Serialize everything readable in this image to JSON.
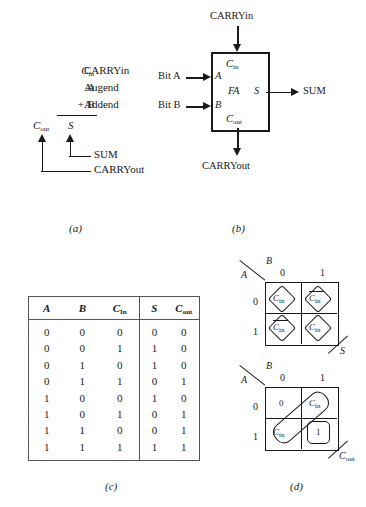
{
  "figure": {
    "panel_labels": {
      "a": "(a)",
      "b": "(b)",
      "c": "(c)",
      "d": "(d)"
    }
  },
  "panel_a": {
    "operands": [
      {
        "symbol": "C",
        "subscript": "in",
        "name": "CARRYin"
      },
      {
        "symbol": "A",
        "subscript": "",
        "name": "Augend"
      },
      {
        "symbol": "+ B",
        "subscript": "",
        "name": "Addend"
      }
    ],
    "results": [
      {
        "symbol": "C",
        "subscript": "out"
      },
      {
        "symbol": "S",
        "subscript": ""
      }
    ],
    "annotations": [
      {
        "label": "SUM",
        "points_to": "S"
      },
      {
        "label": "CARRYout",
        "points_to": "C_out"
      }
    ]
  },
  "panel_b": {
    "block_label": "FA",
    "port_top": {
      "pin": "C",
      "pin_sub": "in",
      "external": "CARRYin"
    },
    "port_bottom": {
      "pin": "C",
      "pin_sub": "out",
      "external": "CARRYout"
    },
    "ports_left": [
      {
        "pin": "A",
        "external": "Bit A"
      },
      {
        "pin": "B",
        "external": "Bit B"
      }
    ],
    "port_right": {
      "pin": "S",
      "external": "SUM"
    }
  },
  "panel_c": {
    "headers_inputs": [
      "A",
      "B",
      "C"
    ],
    "header_cin_sub": "In",
    "headers_outputs": [
      "S",
      "C"
    ],
    "header_cout_sub": "out",
    "rows": [
      {
        "A": "0",
        "B": "0",
        "Cin": "0",
        "S": "0",
        "Cout": "0"
      },
      {
        "A": "0",
        "B": "0",
        "Cin": "1",
        "S": "1",
        "Cout": "0"
      },
      {
        "A": "0",
        "B": "1",
        "Cin": "0",
        "S": "1",
        "Cout": "0"
      },
      {
        "A": "0",
        "B": "1",
        "Cin": "1",
        "S": "0",
        "Cout": "1"
      },
      {
        "A": "1",
        "B": "0",
        "Cin": "0",
        "S": "1",
        "Cout": "0"
      },
      {
        "A": "1",
        "B": "0",
        "Cin": "1",
        "S": "0",
        "Cout": "1"
      },
      {
        "A": "1",
        "B": "1",
        "Cin": "0",
        "S": "0",
        "Cout": "1"
      },
      {
        "A": "1",
        "B": "1",
        "Cin": "1",
        "S": "1",
        "Cout": "1"
      }
    ]
  },
  "panel_d": {
    "kmaps": [
      {
        "output": "S",
        "row_var": "A",
        "col_var": "B",
        "col_headers": [
          "0",
          "1"
        ],
        "row_headers": [
          "0",
          "1"
        ],
        "cells": [
          {
            "row": "0",
            "col": "0",
            "text": "C",
            "sub": "in",
            "overbar": false
          },
          {
            "row": "0",
            "col": "1",
            "text": "C",
            "sub": "in",
            "overbar": true
          },
          {
            "row": "1",
            "col": "0",
            "text": "C",
            "sub": "in",
            "overbar": true
          },
          {
            "row": "1",
            "col": "1",
            "text": "C",
            "sub": "in",
            "overbar": false
          }
        ],
        "groupings": "four diamond loops, one per cell"
      },
      {
        "output": "C",
        "output_sub": "out",
        "row_var": "A",
        "col_var": "B",
        "col_headers": [
          "0",
          "1"
        ],
        "row_headers": [
          "0",
          "1"
        ],
        "cells": [
          {
            "row": "0",
            "col": "0",
            "text": "0",
            "sub": "",
            "overbar": false
          },
          {
            "row": "0",
            "col": "1",
            "text": "C",
            "sub": "in",
            "overbar": false
          },
          {
            "row": "1",
            "col": "0",
            "text": "C",
            "sub": "in",
            "overbar": false
          },
          {
            "row": "1",
            "col": "1",
            "text": "1",
            "sub": "",
            "overbar": false
          }
        ],
        "groupings": "one diagonal loop over the two C-in cells, one rounded box on the 1 cell"
      }
    ]
  },
  "colors": {
    "ink": "#1a1a1a",
    "rule": "#555555",
    "paper": "#ffffff"
  }
}
